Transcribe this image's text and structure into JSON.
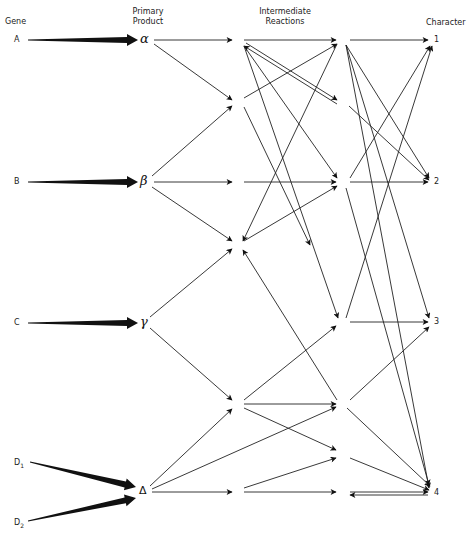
{
  "headers": {
    "gene": "Gene",
    "primary_product": "Primary\nProduct",
    "primary_line1": "Primary",
    "primary_line2": "Product",
    "intermediate_line1": "Intermediate",
    "intermediate_line2": "Reactions",
    "character": "Character"
  },
  "genes": [
    {
      "id": "A",
      "label": "A",
      "x": 18,
      "y": 40
    },
    {
      "id": "B",
      "label": "B",
      "x": 18,
      "y": 182
    },
    {
      "id": "C",
      "label": "C",
      "x": 18,
      "y": 323
    },
    {
      "id": "D1",
      "label": "D",
      "sub": "1",
      "x": 20,
      "y": 462
    },
    {
      "id": "D2",
      "label": "D",
      "sub": "2",
      "x": 15,
      "y": 522
    }
  ],
  "products": [
    {
      "id": "alpha",
      "label": "α",
      "x": 147,
      "y": 40
    },
    {
      "id": "beta",
      "label": "β",
      "x": 147,
      "y": 182
    },
    {
      "id": "gamma",
      "label": "γ",
      "x": 146,
      "y": 323
    },
    {
      "id": "delta",
      "label": "Δ",
      "x": 146,
      "y": 492
    }
  ],
  "characters": [
    {
      "id": "c1",
      "label": "1",
      "x": 438,
      "y": 40
    },
    {
      "id": "c2",
      "label": "2",
      "x": 438,
      "y": 182
    },
    {
      "id": "c3",
      "label": "3",
      "x": 438,
      "y": 322
    },
    {
      "id": "c4",
      "label": "4",
      "x": 438,
      "y": 493
    }
  ],
  "intermediates": {
    "col2": [
      {
        "id": "i1",
        "x": 238,
        "y": 40
      },
      {
        "id": "i2",
        "x": 238,
        "y": 102
      },
      {
        "id": "i3",
        "x": 238,
        "y": 182
      },
      {
        "id": "i4",
        "x": 238,
        "y": 245
      },
      {
        "id": "i5",
        "x": 238,
        "y": 404
      },
      {
        "id": "i6",
        "x": 238,
        "y": 492
      }
    ],
    "col3": [
      {
        "id": "j1",
        "x": 343,
        "y": 40
      },
      {
        "id": "j2",
        "x": 343,
        "y": 102
      },
      {
        "id": "j3",
        "x": 343,
        "y": 182
      },
      {
        "id": "j4",
        "x": 343,
        "y": 322
      },
      {
        "id": "j5",
        "x": 343,
        "y": 404
      },
      {
        "id": "j6",
        "x": 343,
        "y": 455
      },
      {
        "id": "j7",
        "x": 343,
        "y": 492
      }
    ]
  },
  "gene_edges": [
    {
      "from": [
        28,
        40
      ],
      "to": [
        138,
        40
      ]
    },
    {
      "from": [
        28,
        182
      ],
      "to": [
        138,
        182
      ]
    },
    {
      "from": [
        28,
        323
      ],
      "to": [
        138,
        323
      ]
    },
    {
      "from": [
        30,
        462
      ],
      "to": [
        136,
        487
      ]
    },
    {
      "from": [
        28,
        521
      ],
      "to": [
        136,
        498
      ]
    }
  ],
  "edges": [
    {
      "from": [
        154,
        40
      ],
      "to": [
        232,
        40
      ]
    },
    {
      "from": [
        154,
        44
      ],
      "to": [
        232,
        100
      ]
    },
    {
      "from": [
        152,
        176
      ],
      "to": [
        232,
        106
      ]
    },
    {
      "from": [
        154,
        182
      ],
      "to": [
        232,
        182
      ]
    },
    {
      "from": [
        152,
        187
      ],
      "to": [
        232,
        241
      ]
    },
    {
      "from": [
        150,
        317
      ],
      "to": [
        232,
        249
      ]
    },
    {
      "from": [
        150,
        328
      ],
      "to": [
        232,
        400
      ]
    },
    {
      "from": [
        150,
        486
      ],
      "to": [
        232,
        409
      ]
    },
    {
      "from": [
        152,
        489
      ],
      "to": [
        336,
        407
      ]
    },
    {
      "from": [
        152,
        492
      ],
      "to": [
        232,
        492
      ]
    },
    {
      "from": [
        244,
        40
      ],
      "to": [
        336,
        40
      ]
    },
    {
      "from": [
        246,
        43
      ],
      "to": [
        337,
        100
      ]
    },
    {
      "from": [
        337,
        104
      ],
      "to": [
        244,
        46
      ],
      "parallel": true
    },
    {
      "from": [
        244,
        46
      ],
      "to": [
        337,
        178
      ]
    },
    {
      "from": [
        244,
        46
      ],
      "to": [
        338,
        318
      ]
    },
    {
      "from": [
        244,
        98
      ],
      "to": [
        337,
        44
      ]
    },
    {
      "from": [
        244,
        107
      ],
      "to": [
        310,
        245
      ]
    },
    {
      "from": [
        244,
        182
      ],
      "to": [
        336,
        182
      ]
    },
    {
      "from": [
        244,
        241
      ],
      "to": [
        337,
        186
      ]
    },
    {
      "from": [
        337,
        44
      ],
      "to": [
        243,
        241
      ]
    },
    {
      "from": [
        337,
        400
      ],
      "to": [
        243,
        250
      ]
    },
    {
      "from": [
        244,
        400
      ],
      "to": [
        336,
        326
      ]
    },
    {
      "from": [
        244,
        404
      ],
      "to": [
        336,
        404
      ]
    },
    {
      "from": [
        244,
        408
      ],
      "to": [
        336,
        450
      ]
    },
    {
      "from": [
        244,
        488
      ],
      "to": [
        336,
        458
      ]
    },
    {
      "from": [
        244,
        492
      ],
      "to": [
        336,
        492
      ]
    },
    {
      "from": [
        350,
        40
      ],
      "to": [
        428,
        40
      ]
    },
    {
      "from": [
        346,
        45
      ],
      "to": [
        429,
        178
      ]
    },
    {
      "from": [
        346,
        45
      ],
      "to": [
        429,
        488
      ]
    },
    {
      "from": [
        349,
        106
      ],
      "to": [
        429,
        180
      ]
    },
    {
      "from": [
        346,
        45
      ],
      "to": [
        429,
        318
      ]
    },
    {
      "from": [
        350,
        178
      ],
      "to": [
        430,
        46
      ]
    },
    {
      "from": [
        350,
        182
      ],
      "to": [
        428,
        182
      ]
    },
    {
      "from": [
        346,
        188
      ],
      "to": [
        429,
        485
      ]
    },
    {
      "from": [
        346,
        318
      ],
      "to": [
        432,
        46
      ]
    },
    {
      "from": [
        350,
        322
      ],
      "to": [
        428,
        322
      ]
    },
    {
      "from": [
        350,
        400
      ],
      "to": [
        429,
        327
      ]
    },
    {
      "from": [
        347,
        408
      ],
      "to": [
        430,
        486
      ]
    },
    {
      "from": [
        350,
        458
      ],
      "to": [
        429,
        490
      ]
    },
    {
      "from": [
        350,
        492
      ],
      "to": [
        428,
        492
      ]
    },
    {
      "from": [
        428,
        495
      ],
      "to": [
        350,
        495
      ],
      "parallel": true
    }
  ]
}
